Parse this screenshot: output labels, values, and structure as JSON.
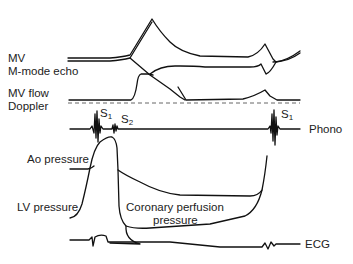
{
  "diagram": {
    "type": "physiological waveform timing diagram",
    "traces": [
      {
        "id": "mv_mmode",
        "label_line1": "MV",
        "label_line2": "M-mode echo"
      },
      {
        "id": "mv_doppler",
        "label_line1": "MV flow",
        "label_line2": "Doppler"
      },
      {
        "id": "phono",
        "label": "Phono"
      },
      {
        "id": "ao_pressure",
        "label": "Ao pressure"
      },
      {
        "id": "lv_pressure",
        "label": "LV pressure"
      },
      {
        "id": "coronary",
        "label_line1": "Coronary perfusion",
        "label_line2": "pressure"
      },
      {
        "id": "ecg",
        "label": "ECG"
      }
    ],
    "heart_sounds": {
      "s1_first": {
        "main": "S",
        "sub": "1"
      },
      "s2": {
        "main": "S",
        "sub": "2"
      },
      "s1_second": {
        "main": "S",
        "sub": "1"
      }
    }
  },
  "colors": {
    "line": "#111111",
    "text": "#222222",
    "background": "#ffffff",
    "dashed": "#555555"
  }
}
